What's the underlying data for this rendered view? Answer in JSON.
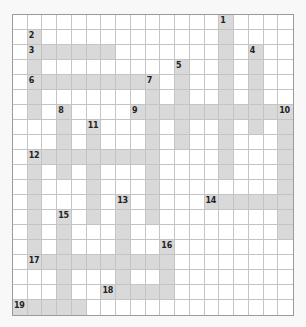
{
  "puzzle": {
    "type": "crossword",
    "cols": 19,
    "rows": 20,
    "colors": {
      "filled": "#d9d9d9",
      "empty": "#ffffff",
      "grid_line": "#c4c4c4",
      "border": "#9a9a9a",
      "background": "#f8f8f8",
      "number": "#222222"
    },
    "entries": [
      {
        "number": "1",
        "direction": "down",
        "row": 0,
        "col": 14,
        "length": 11
      },
      {
        "number": "2",
        "direction": "down",
        "row": 1,
        "col": 1,
        "length": 6
      },
      {
        "number": "3",
        "direction": "across",
        "row": 2,
        "col": 1,
        "length": 6
      },
      {
        "number": "4",
        "direction": "down",
        "row": 2,
        "col": 16,
        "length": 6
      },
      {
        "number": "5",
        "direction": "down",
        "row": 3,
        "col": 11,
        "length": 6
      },
      {
        "number": "6",
        "direction": "across",
        "row": 4,
        "col": 1,
        "length": 9
      },
      {
        "number": "7",
        "direction": "down",
        "row": 4,
        "col": 9,
        "length": 10
      },
      {
        "number": "8",
        "direction": "down",
        "row": 6,
        "col": 3,
        "length": 5
      },
      {
        "number": "9",
        "direction": "across",
        "row": 6,
        "col": 8,
        "length": 11
      },
      {
        "number": "10",
        "direction": "down",
        "row": 6,
        "col": 18,
        "length": 9
      },
      {
        "number": "11",
        "direction": "down",
        "row": 7,
        "col": 5,
        "length": 7
      },
      {
        "number": "12",
        "direction": "across",
        "row": 9,
        "col": 1,
        "length": 9
      },
      {
        "number": "12",
        "direction": "down",
        "row": 9,
        "col": 1,
        "length": 8
      },
      {
        "number": "13",
        "direction": "down",
        "row": 12,
        "col": 7,
        "length": 7
      },
      {
        "number": "14",
        "direction": "across",
        "row": 12,
        "col": 13,
        "length": 6
      },
      {
        "number": "15",
        "direction": "down",
        "row": 13,
        "col": 3,
        "length": 7
      },
      {
        "number": "16",
        "direction": "down",
        "row": 15,
        "col": 10,
        "length": 4
      },
      {
        "number": "17",
        "direction": "across",
        "row": 16,
        "col": 1,
        "length": 9
      },
      {
        "number": "18",
        "direction": "across",
        "row": 18,
        "col": 6,
        "length": 5
      },
      {
        "number": "19",
        "direction": "across",
        "row": 19,
        "col": 0,
        "length": 5
      }
    ]
  }
}
